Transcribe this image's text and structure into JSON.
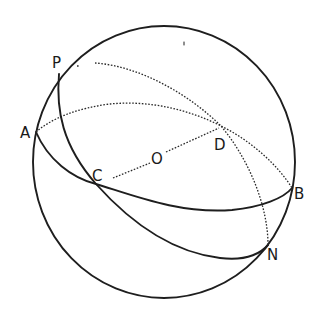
{
  "diagram": {
    "type": "celestial-sphere",
    "colors": {
      "stroke": "#1e1e1e",
      "background": "#ffffff"
    },
    "sphere": {
      "center": [
        164,
        162
      ],
      "rx": 131,
      "ry": 136
    },
    "points": {
      "A": {
        "label": "A",
        "pos": [
          36,
          132
        ]
      },
      "P": {
        "label": "P",
        "pos": [
          59,
          74
        ]
      },
      "C": {
        "label": "C",
        "pos": [
          96,
          184
        ]
      },
      "O": {
        "label": "O",
        "pos": [
          157,
          156
        ]
      },
      "D": {
        "label": "D",
        "pos": [
          221,
          126
        ]
      },
      "B": {
        "label": "B",
        "pos": [
          292,
          188
        ]
      },
      "N": {
        "label": "N",
        "pos": [
          268,
          245
        ]
      }
    },
    "great_circles": [
      {
        "name": "circle-ACB",
        "through": [
          "A",
          "C",
          "B",
          "D"
        ],
        "front": "solid",
        "back": "dotted"
      },
      {
        "name": "circle-PCN",
        "through": [
          "P",
          "C",
          "N",
          "D"
        ],
        "front": "solid",
        "back": "dotted"
      }
    ],
    "segments": [
      {
        "name": "diameter-CD",
        "from": "C",
        "to": "D",
        "through": "O",
        "style": "dotted"
      }
    ]
  }
}
